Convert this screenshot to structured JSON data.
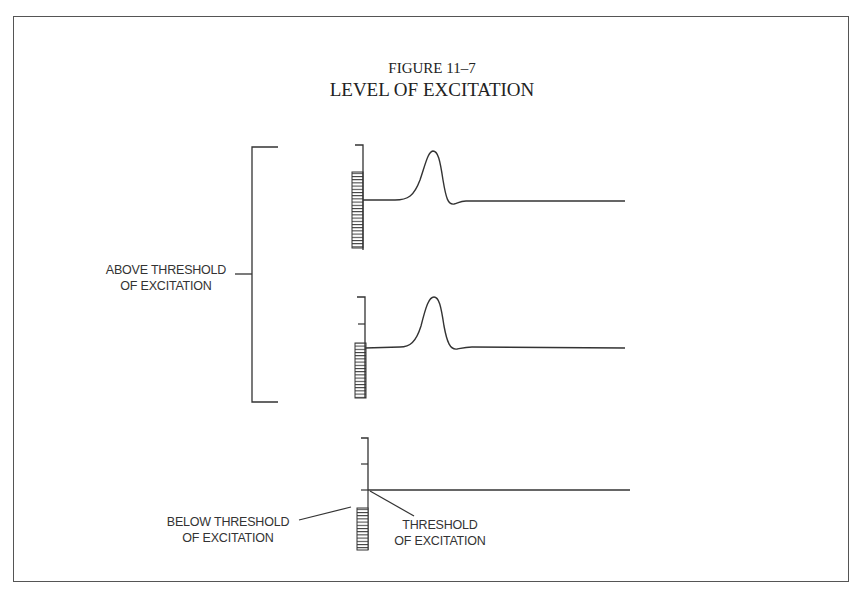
{
  "figure": {
    "number": "FIGURE 11–7",
    "title": "LEVEL OF EXCITATION"
  },
  "labels": {
    "above_threshold_line1": "ABOVE THRESHOLD",
    "above_threshold_line2": "OF EXCITATION",
    "below_threshold_line1": "BELOW THRESHOLD",
    "below_threshold_line2": "OF EXCITATION",
    "threshold_line1": "THRESHOLD",
    "threshold_line2": "OF EXCITATION"
  },
  "panels": [
    {
      "name": "above-threshold-strong-stimulus",
      "stimulus": "large",
      "response": "action-potential"
    },
    {
      "name": "above-threshold-threshold-stimulus",
      "stimulus": "medium",
      "response": "action-potential"
    },
    {
      "name": "below-threshold",
      "stimulus": "small",
      "response": "none"
    }
  ],
  "colors": {
    "ink": "#333333",
    "frame": "#555555",
    "background": "#ffffff"
  }
}
